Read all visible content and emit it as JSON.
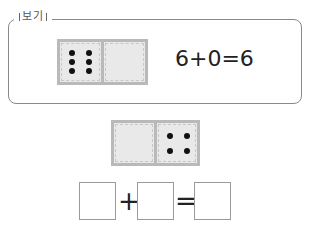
{
  "example": {
    "label": "보기",
    "domino": {
      "left_pips": 6,
      "right_pips": 0
    },
    "equation": "6+0=6"
  },
  "problem": {
    "domino": {
      "left_pips": 0,
      "right_pips": 4
    },
    "operators": {
      "plus": "+",
      "equals": "="
    },
    "answer_boxes": [
      "",
      "",
      ""
    ]
  }
}
